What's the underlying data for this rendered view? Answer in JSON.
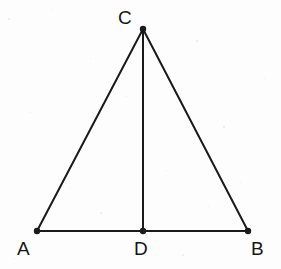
{
  "figure": {
    "kind": "geometry-diagram",
    "background_color": "#fdfdfd",
    "stroke_color": "#1a1a1a",
    "label_color": "#161616",
    "stroke_width": 2,
    "vertex_dot_radius": 3.2,
    "canvas": {
      "width": 281,
      "height": 269
    }
  },
  "points": [
    {
      "id": "C",
      "label": "C",
      "x": 143,
      "y": 29,
      "label_x": 118,
      "label_y": 8,
      "role": "apex"
    },
    {
      "id": "A",
      "label": "A",
      "x": 37,
      "y": 231,
      "label_x": 17,
      "label_y": 239,
      "role": "base-left"
    },
    {
      "id": "D",
      "label": "D",
      "x": 143,
      "y": 231,
      "label_x": 134,
      "label_y": 239,
      "role": "base-midpoint"
    },
    {
      "id": "B",
      "label": "B",
      "x": 248,
      "y": 231,
      "label_x": 251,
      "label_y": 239,
      "role": "base-right"
    }
  ],
  "segments": [
    {
      "id": "AB",
      "name": "base-segment-ab",
      "from": "A",
      "to": "B",
      "x1": 37,
      "y1": 231,
      "x2": 248,
      "y2": 231
    },
    {
      "id": "AC",
      "name": "left-segment-ac",
      "from": "A",
      "to": "C",
      "x1": 37,
      "y1": 231,
      "x2": 143,
      "y2": 29
    },
    {
      "id": "BC",
      "name": "right-segment-bc",
      "from": "B",
      "to": "C",
      "x1": 248,
      "y1": 231,
      "x2": 143,
      "y2": 29
    },
    {
      "id": "CD",
      "name": "median-segment-cd",
      "from": "C",
      "to": "D",
      "x1": 143,
      "y1": 29,
      "x2": 143,
      "y2": 231
    }
  ],
  "specks": [
    {
      "x": 8,
      "y": 18,
      "size": 2
    },
    {
      "x": 52,
      "y": 9,
      "size": 1
    },
    {
      "x": 196,
      "y": 40,
      "size": 2
    },
    {
      "x": 30,
      "y": 112,
      "size": 1
    },
    {
      "x": 126,
      "y": 96,
      "size": 1
    },
    {
      "x": 223,
      "y": 126,
      "size": 2
    },
    {
      "x": 70,
      "y": 188,
      "size": 1
    },
    {
      "x": 166,
      "y": 170,
      "size": 1
    },
    {
      "x": 100,
      "y": 212,
      "size": 2
    },
    {
      "x": 208,
      "y": 206,
      "size": 1
    },
    {
      "x": 14,
      "y": 258,
      "size": 1
    },
    {
      "x": 182,
      "y": 254,
      "size": 2
    },
    {
      "x": 264,
      "y": 78,
      "size": 1
    },
    {
      "x": 90,
      "y": 58,
      "size": 1
    },
    {
      "x": 240,
      "y": 182,
      "size": 1
    }
  ]
}
